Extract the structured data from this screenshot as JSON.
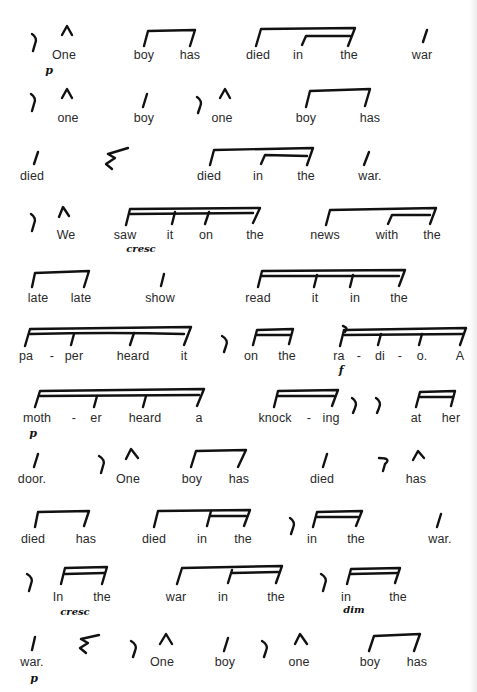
{
  "document": {
    "type": "rhythmic speech score page",
    "rows": [
      {
        "words": [
          "One",
          "boy",
          "has",
          "died",
          "in",
          "the",
          "war"
        ],
        "dynamics": [
          "p"
        ]
      },
      {
        "words": [
          "one",
          "boy",
          "one",
          "boy",
          "has"
        ],
        "dynamics": []
      },
      {
        "words": [
          "died",
          "died",
          "in",
          "the",
          "war."
        ],
        "dynamics": []
      },
      {
        "words": [
          "We",
          "saw",
          "it",
          "on",
          "the",
          "news",
          "with",
          "the"
        ],
        "dynamics": [
          "cresc"
        ]
      },
      {
        "words": [
          "late",
          "late",
          "show",
          "read",
          "it",
          "in",
          "the"
        ],
        "dynamics": []
      },
      {
        "words": [
          "pa",
          "-",
          "per",
          "heard",
          "it",
          "on",
          "the",
          "ra",
          "-",
          "di",
          "-",
          "o.",
          "A"
        ],
        "dynamics": [
          "f"
        ]
      },
      {
        "words": [
          "moth",
          "-",
          "er",
          "heard",
          "a",
          "knock",
          "-",
          "ing",
          "at",
          "her"
        ],
        "dynamics": [
          "p"
        ]
      },
      {
        "words": [
          "door.",
          "One",
          "boy",
          "has",
          "died",
          "has"
        ],
        "dynamics": []
      },
      {
        "words": [
          "died",
          "has",
          "died",
          "in",
          "the",
          "in",
          "the",
          "war."
        ],
        "dynamics": []
      },
      {
        "words": [
          "In",
          "the",
          "war",
          "in",
          "the",
          "in",
          "the"
        ],
        "dynamics": [
          "cresc",
          "dim"
        ]
      },
      {
        "words": [
          "war.",
          "One",
          "boy",
          "one",
          "boy",
          "has"
        ],
        "dynamics": [
          "p"
        ]
      }
    ],
    "symbols": {
      "eighth_rest": "eighth-rest-icon",
      "quarter_rest": "quarter-rest-icon",
      "accent": "accent-caret-icon",
      "quarter_note": "stem-icon",
      "beam": "beam-icon"
    }
  }
}
